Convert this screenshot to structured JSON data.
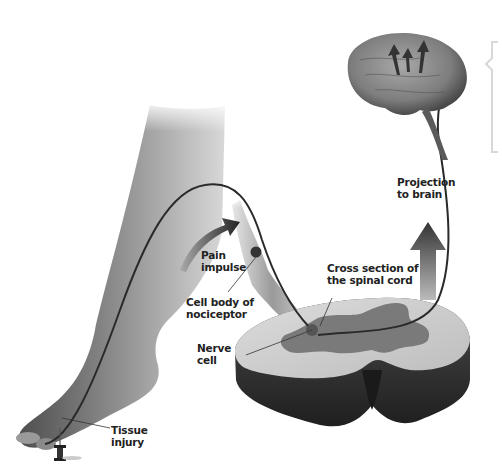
{
  "figure": {
    "labels": {
      "projection": "Projection\nto brain",
      "pain_impulse": "Pain\nimpulse",
      "cross_section": "Cross section of\nthe spinal cord",
      "cell_body": "Cell body of\nnociceptor",
      "nerve_cell": "Nerve\ncell",
      "tissue_injury": "Tissue\ninjury"
    }
  },
  "colors": {
    "skin_dark": "#5a5a5a",
    "skin_light": "#e8e8e8",
    "grey_matter": "#7a7a7a",
    "white_matter": "#cfcfcf",
    "cord_side": "#3a3a3a",
    "nerve_line": "#2a2a2a",
    "arrow": "#444444",
    "brain": "#8c8c8c"
  }
}
